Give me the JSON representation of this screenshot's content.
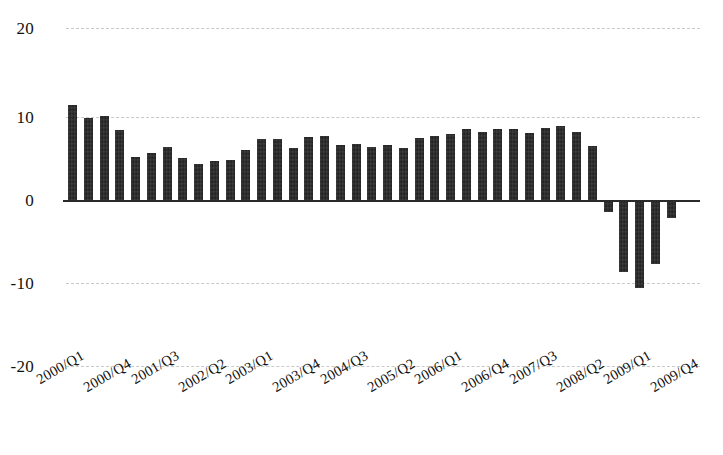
{
  "chart_data": {
    "type": "bar",
    "title": "",
    "subtitle": "",
    "xlabel": "",
    "ylabel": "",
    "ylim": [
      -20,
      20
    ],
    "yticks": [
      20,
      10,
      0,
      -10,
      -20
    ],
    "ytick_labels": [
      "20",
      "10",
      "0",
      "-10",
      "-20"
    ],
    "grid": true,
    "grid_axis": "y",
    "legend": false,
    "legend_position": "none",
    "bar_color": "#1c1c1c",
    "zero_line": true,
    "xtick_interval": 3,
    "categories": [
      "2000/Q1",
      "2000/Q2",
      "2000/Q3",
      "2000/Q4",
      "2001/Q1",
      "2001/Q2",
      "2001/Q3",
      "2001/Q4",
      "2002/Q1",
      "2002/Q2",
      "2002/Q3",
      "2002/Q4",
      "2003/Q1",
      "2003/Q2",
      "2003/Q3",
      "2003/Q4",
      "2004/Q1",
      "2004/Q2",
      "2004/Q3",
      "2004/Q4",
      "2005/Q1",
      "2005/Q2",
      "2005/Q3",
      "2005/Q4",
      "2006/Q1",
      "2006/Q2",
      "2006/Q3",
      "2006/Q4",
      "2007/Q1",
      "2007/Q2",
      "2007/Q3",
      "2007/Q4",
      "2008/Q1",
      "2008/Q2",
      "2008/Q3",
      "2008/Q4",
      "2009/Q1",
      "2009/Q2",
      "2009/Q3",
      "2009/Q4"
    ],
    "xtick_labels_shown": [
      "2000/Q1",
      "2000/Q4",
      "2001/Q3",
      "2002/Q2",
      "2003/Q1",
      "2003/Q4",
      "2004/Q3",
      "2005/Q2",
      "2006/Q1",
      "2006/Q4",
      "2007/Q3",
      "2008/Q2",
      "2009/Q1",
      "2009/Q4"
    ],
    "values": [
      11.4,
      9.9,
      10.1,
      8.4,
      5.2,
      5.7,
      6.4,
      5.1,
      4.3,
      4.7,
      4.8,
      6.0,
      7.4,
      7.4,
      6.3,
      7.6,
      7.7,
      6.6,
      6.7,
      6.4,
      6.6,
      6.3,
      7.5,
      7.7,
      8.0,
      8.6,
      8.2,
      8.5,
      8.5,
      8.1,
      8.7,
      8.9,
      8.2,
      6.5,
      -1.5,
      -8.7,
      -10.6,
      -7.7,
      -2.2,
      0.0
    ]
  }
}
